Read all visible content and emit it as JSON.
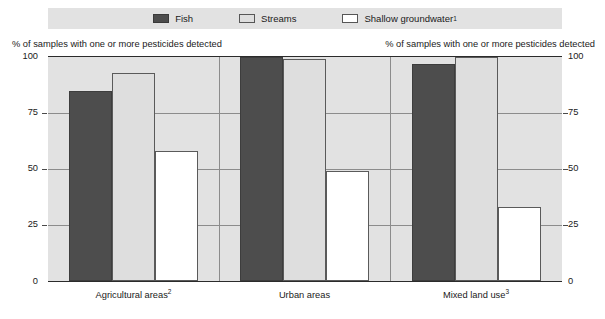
{
  "chart_data": {
    "type": "bar",
    "title": "",
    "subtitle": "",
    "xlabel": "",
    "ylabel": "% of samples with one or more pesticides detected",
    "ylabel_right": "% of samples with one or more pesticides detected",
    "ylim": [
      0,
      100
    ],
    "yticks": [
      0,
      25,
      50,
      75,
      100
    ],
    "grid": true,
    "legend_position": "top",
    "categories": [
      "Agricultural areas",
      "Urban areas",
      "Mixed land use"
    ],
    "category_labels": [
      "Agricultural areas2",
      "Urban areas",
      "Mixed land use3"
    ],
    "category_footnotes": [
      "2",
      "",
      "3"
    ],
    "series": [
      {
        "name": "Fish",
        "color": "#4d4d4d",
        "values": [
          85,
          100,
          97
        ]
      },
      {
        "name": "Streams",
        "color": "#dedede",
        "values": [
          93,
          99,
          100
        ]
      },
      {
        "name": "Shallow groundwater",
        "color": "#ffffff",
        "values": [
          58,
          49,
          33
        ]
      }
    ]
  },
  "legend": {
    "items": [
      {
        "label": "Fish",
        "footnote": ""
      },
      {
        "label": "Streams",
        "footnote": ""
      },
      {
        "label": "Shallow groundwater",
        "footnote": "1"
      }
    ]
  },
  "axes": {
    "left_caption": "% of samples with one or more pesticides detected",
    "right_caption": "% of samples with one or more pesticides detected",
    "ticks": [
      "100",
      "75",
      "50",
      "25",
      "0"
    ]
  },
  "categories": [
    {
      "label": "Agricultural areas",
      "footnote": "2"
    },
    {
      "label": "Urban areas",
      "footnote": ""
    },
    {
      "label": "Mixed land use",
      "footnote": "3"
    }
  ],
  "colors": {
    "fish": "#4d4d4d",
    "streams": "#dedede",
    "groundwater": "#ffffff",
    "plot_background": "#e2e2e2",
    "gridline": "#8c8c8c",
    "axis": "#2b2b2b"
  }
}
